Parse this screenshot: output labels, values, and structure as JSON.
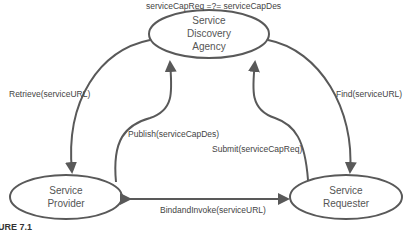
{
  "diagram": {
    "condition": "serviceCapReq =?= serviceCapDes",
    "nodes": {
      "agency": {
        "line1": "Service",
        "line2": "Discovery",
        "line3": "Agency"
      },
      "provider": {
        "line1": "Service",
        "line2": "Provider"
      },
      "requester": {
        "line1": "Service",
        "line2": "Requester"
      }
    },
    "edges": {
      "retrieve": "Retrieve(serviceURL)",
      "publish": "Publish(serviceCapDes)",
      "submit": "Submit(serviceCapReq)",
      "find": "Find(serviceURL)",
      "bind": "BindandInvoke(serviceURL)"
    },
    "caption": "URE 7.1",
    "colors": {
      "line": "#595959",
      "text": "#444444"
    }
  }
}
